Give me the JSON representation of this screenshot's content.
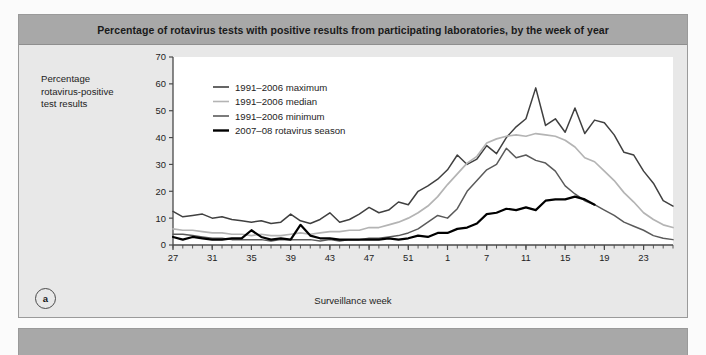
{
  "panel_a": {
    "letter": "a",
    "title": "Percentage of rotavirus tests with positive results from participating laboratories, by the week of year",
    "y_axis_title_lines": [
      "Percentage",
      "rotavirus-positive",
      "test results"
    ],
    "x_axis_title": "Surveillance week"
  },
  "colors": {
    "panel_background": "#e8e8e8",
    "title_bar": "#a8a8a8",
    "plot_background": "#ffffff",
    "axis": "#4a4a4a",
    "maximum": "#404040",
    "median": "#b4b4b4",
    "minimum": "#5a5a5a",
    "season": "#000000"
  },
  "chart_data": {
    "type": "line",
    "title": "Percentage of rotavirus tests with positive results from participating laboratories, by the week of year",
    "xlabel": "Surveillance week",
    "ylabel": "Percentage rotavirus-positive test results",
    "ylim": [
      0,
      70
    ],
    "yticks": [
      0,
      10,
      20,
      30,
      40,
      50,
      60,
      70
    ],
    "ytick_labels": [
      "0",
      "10",
      "20",
      "30",
      "40",
      "50",
      "60",
      "70"
    ],
    "grid": false,
    "legend_position": "upper-left-inside",
    "x_index": [
      0,
      1,
      2,
      3,
      4,
      5,
      6,
      7,
      8,
      9,
      10,
      11,
      12,
      13,
      14,
      15,
      16,
      17,
      18,
      19,
      20,
      21,
      22,
      23,
      24,
      25,
      26,
      27,
      28,
      29,
      30,
      31,
      32,
      33,
      34,
      35,
      36,
      37,
      38,
      39,
      40,
      41,
      42,
      43,
      44,
      45,
      46,
      47,
      48,
      49,
      50,
      51
    ],
    "x_week_labels": [
      "27",
      "28",
      "29",
      "30",
      "31",
      "32",
      "33",
      "34",
      "35",
      "36",
      "37",
      "38",
      "39",
      "40",
      "41",
      "42",
      "43",
      "44",
      "45",
      "46",
      "47",
      "48",
      "49",
      "50",
      "51",
      "52",
      "1",
      "2",
      "3",
      "4",
      "5",
      "6",
      "7",
      "8",
      "9",
      "10",
      "11",
      "12",
      "13",
      "14",
      "15",
      "16",
      "17",
      "18",
      "19",
      "20",
      "21",
      "22",
      "23",
      "24",
      "25",
      "26"
    ],
    "xticks_labeled": [
      {
        "index": 0,
        "label": "27"
      },
      {
        "index": 4,
        "label": "31"
      },
      {
        "index": 8,
        "label": "35"
      },
      {
        "index": 12,
        "label": "39"
      },
      {
        "index": 16,
        "label": "43"
      },
      {
        "index": 20,
        "label": "47"
      },
      {
        "index": 24,
        "label": "51"
      },
      {
        "index": 28,
        "label": "1"
      },
      {
        "index": 32,
        "label": "7"
      },
      {
        "index": 36,
        "label": "11"
      },
      {
        "index": 40,
        "label": "15"
      },
      {
        "index": 44,
        "label": "19"
      },
      {
        "index": 48,
        "label": "23"
      }
    ],
    "series": [
      {
        "name": "1991–2006 maximum",
        "color": "#404040",
        "width": 1.5,
        "values": [
          12.5,
          10.5,
          11.0,
          11.5,
          10.0,
          10.5,
          9.5,
          9.0,
          8.5,
          9.0,
          8.0,
          8.5,
          11.5,
          9.0,
          8.0,
          9.5,
          12.0,
          8.5,
          9.5,
          11.5,
          14.0,
          12.0,
          13.0,
          16.0,
          15.0,
          20.0,
          22.0,
          24.5,
          28.0,
          33.5,
          30.0,
          32.0,
          37.0,
          34.0,
          40.0,
          44.0,
          47.0,
          58.5,
          44.5,
          47.0,
          42.0,
          51.0,
          41.5,
          46.5,
          45.5,
          41.0,
          34.5,
          33.5,
          27.5,
          23.0,
          16.5,
          14.5
        ]
      },
      {
        "name": "1991–2006 median",
        "color": "#b4b4b4",
        "width": 1.7,
        "values": [
          6.0,
          5.5,
          5.5,
          5.0,
          4.5,
          4.5,
          4.0,
          4.0,
          3.5,
          4.0,
          3.5,
          3.5,
          4.0,
          4.5,
          4.0,
          4.5,
          5.0,
          5.0,
          5.5,
          5.5,
          6.5,
          6.5,
          7.5,
          8.5,
          10.0,
          12.0,
          14.5,
          18.0,
          22.5,
          26.5,
          30.5,
          33.0,
          38.0,
          39.5,
          40.5,
          41.0,
          40.5,
          41.5,
          41.0,
          40.5,
          39.0,
          36.5,
          32.5,
          31.0,
          27.5,
          24.0,
          19.5,
          16.0,
          12.0,
          9.5,
          7.5,
          6.5
        ]
      },
      {
        "name": "1991–2006 minimum",
        "color": "#5a5a5a",
        "width": 1.5,
        "values": [
          4.0,
          4.0,
          3.5,
          3.0,
          2.5,
          2.5,
          2.0,
          2.0,
          2.0,
          2.0,
          1.5,
          2.0,
          2.0,
          2.0,
          2.0,
          1.5,
          2.0,
          1.5,
          2.0,
          2.0,
          2.5,
          2.5,
          3.0,
          3.5,
          4.5,
          6.0,
          8.5,
          11.0,
          10.0,
          13.5,
          20.0,
          24.0,
          28.0,
          30.0,
          36.0,
          32.5,
          33.5,
          31.5,
          30.5,
          27.5,
          22.0,
          19.0,
          16.5,
          15.0,
          13.0,
          11.0,
          8.5,
          7.0,
          5.5,
          3.5,
          2.5,
          2.0
        ]
      },
      {
        "name": "2007–08 rotavirus season",
        "color": "#000000",
        "width": 2.2,
        "values": [
          3.0,
          2.0,
          3.0,
          2.5,
          2.0,
          2.0,
          2.5,
          2.5,
          5.5,
          3.0,
          2.0,
          2.5,
          2.0,
          7.5,
          3.5,
          2.5,
          2.5,
          2.0,
          2.0,
          2.0,
          2.0,
          2.0,
          2.5,
          2.0,
          2.5,
          3.5,
          3.0,
          4.5,
          4.5,
          6.0,
          6.5,
          8.0,
          11.5,
          12.0,
          13.5,
          13.0,
          14.0,
          13.0,
          16.5,
          17.0,
          17.0,
          18.0,
          17.0,
          15.0
        ]
      }
    ],
    "legend": [
      {
        "label": "1991–2006 maximum",
        "color": "#404040",
        "width": 1.6
      },
      {
        "label": "1991–2006 median",
        "color": "#b4b4b4",
        "width": 1.6
      },
      {
        "label": "1991–2006 minimum",
        "color": "#5a5a5a",
        "width": 1.6
      },
      {
        "label": "2007–08 rotavirus season",
        "color": "#000000",
        "width": 2.4
      }
    ]
  }
}
